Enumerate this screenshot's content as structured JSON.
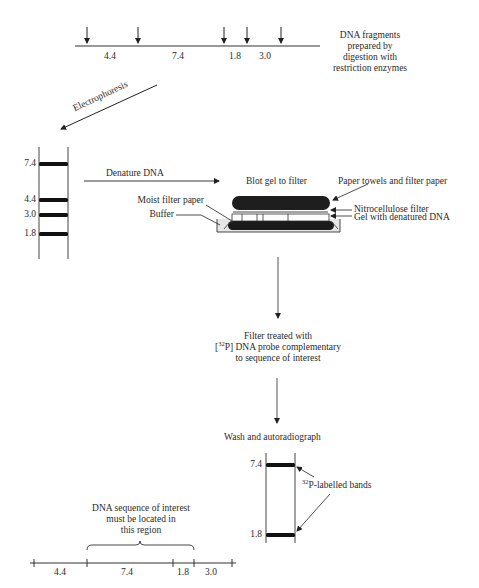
{
  "top_map": {
    "caption": [
      "DNA fragments",
      "prepared by",
      "digestion with",
      "restriction enzymes"
    ],
    "segments": [
      {
        "label": "4.4"
      },
      {
        "label": "7.4"
      },
      {
        "label": "1.8"
      },
      {
        "label": "3.0"
      }
    ],
    "cut_arrow_count": 5
  },
  "steps": {
    "electrophoresis": "Electrophoresis",
    "denature": "Denature DNA",
    "blot": "Blot gel to filter",
    "probe": {
      "line1": "Filter treated with",
      "line2_prefix": "[",
      "line2_sup": "32",
      "line2_rest": "P] DNA probe complementary",
      "line3": "to sequence of interest"
    },
    "wash": "Wash and autoradiograph"
  },
  "gel": {
    "bands": [
      {
        "label": "7.4"
      },
      {
        "label": "4.4"
      },
      {
        "label": "3.0"
      },
      {
        "label": "1.8"
      }
    ]
  },
  "blot_apparatus": {
    "labels": {
      "towels": "Paper towels and filter paper",
      "nitrocellulose": "Nitrocellulose filter",
      "gel": "Gel with denatured DNA",
      "moist": "Moist filter paper",
      "buffer": "Buffer"
    }
  },
  "autoradiograph": {
    "bands": [
      {
        "label": "7.4"
      },
      {
        "label": "1.8"
      }
    ],
    "annotation_sup": "32",
    "annotation_rest": "P-labelled bands"
  },
  "bottom_map": {
    "caption": [
      "DNA sequence of interest",
      "must be located in",
      "this region"
    ],
    "segments": [
      {
        "label": "4.4"
      },
      {
        "label": "7.4"
      },
      {
        "label": "1.8"
      },
      {
        "label": "3.0"
      }
    ]
  }
}
